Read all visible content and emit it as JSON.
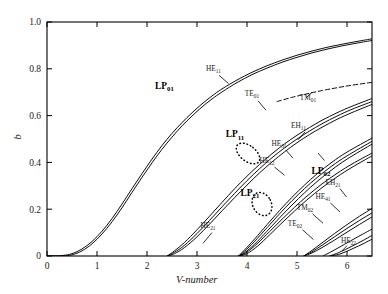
{
  "chart_data": {
    "type": "line",
    "title": "",
    "xlabel": "V-number",
    "ylabel": "b",
    "xlim": [
      0,
      6.5
    ],
    "ylim": [
      0,
      1.0
    ],
    "xticks": [
      0,
      1,
      2,
      3,
      4,
      5,
      6
    ],
    "xticklabels": [
      "0",
      "1",
      "2",
      "3",
      "4",
      "5",
      "6"
    ],
    "yticks": [
      0,
      0.2,
      0.4,
      0.6,
      0.8,
      1.0
    ],
    "yticklabels": [
      "0",
      "0.2",
      "0.4",
      "0.6",
      "0.8",
      "1.0"
    ],
    "grid": false,
    "legend": "none",
    "annotations": [
      {
        "text": "LP",
        "sub": "01",
        "bold": true,
        "x": 2.35,
        "y": 0.715
      },
      {
        "text": "LP",
        "sub": "11",
        "bold": true,
        "x": 3.76,
        "y": 0.508
      },
      {
        "text": "LP",
        "sub": "21",
        "bold": true,
        "x": 4.06,
        "y": 0.258
      },
      {
        "text": "LP",
        "sub": "02",
        "bold": true,
        "x": 5.48,
        "y": 0.352
      },
      {
        "text": "HE",
        "sub": "11",
        "bold": false,
        "x": 3.33,
        "y": 0.792
      },
      {
        "text": "TE",
        "sub": "01",
        "bold": false,
        "x": 4.1,
        "y": 0.683
      },
      {
        "text": "TM",
        "sub": "01",
        "bold": false,
        "x": 5.22,
        "y": 0.667
      },
      {
        "text": "EH",
        "sub": "11",
        "bold": false,
        "x": 5.03,
        "y": 0.548
      },
      {
        "text": "HE",
        "sub": "31",
        "bold": false,
        "x": 4.64,
        "y": 0.47
      },
      {
        "text": "HE",
        "sub": "12",
        "bold": false,
        "x": 4.4,
        "y": 0.398
      },
      {
        "text": "HE",
        "sub": "21",
        "bold": false,
        "x": 3.22,
        "y": 0.118
      },
      {
        "text": "EH",
        "sub": "21",
        "bold": false,
        "x": 5.72,
        "y": 0.305
      },
      {
        "text": "HE",
        "sub": "41",
        "bold": false,
        "x": 5.52,
        "y": 0.243
      },
      {
        "text": "TM",
        "sub": "02",
        "bold": false,
        "x": 5.16,
        "y": 0.196
      },
      {
        "text": "TE",
        "sub": "02",
        "bold": false,
        "x": 4.96,
        "y": 0.128
      },
      {
        "text": "HE",
        "sub": "22",
        "bold": false,
        "x": 6.03,
        "y": 0.055
      }
    ],
    "series": [
      {
        "name": "LP01-upper",
        "style": "solid",
        "points": [
          [
            0.0,
            0.0
          ],
          [
            0.3,
            0.002
          ],
          [
            0.5,
            0.01
          ],
          [
            0.7,
            0.03
          ],
          [
            0.9,
            0.062
          ],
          [
            1.1,
            0.106
          ],
          [
            1.3,
            0.16
          ],
          [
            1.5,
            0.222
          ],
          [
            1.7,
            0.288
          ],
          [
            1.9,
            0.352
          ],
          [
            2.1,
            0.414
          ],
          [
            2.3,
            0.472
          ],
          [
            2.5,
            0.524
          ],
          [
            2.7,
            0.57
          ],
          [
            2.9,
            0.612
          ],
          [
            3.1,
            0.65
          ],
          [
            3.3,
            0.684
          ],
          [
            3.5,
            0.714
          ],
          [
            3.8,
            0.752
          ],
          [
            4.1,
            0.785
          ],
          [
            4.4,
            0.813
          ],
          [
            4.7,
            0.837
          ],
          [
            5.0,
            0.858
          ],
          [
            5.3,
            0.876
          ],
          [
            5.6,
            0.892
          ],
          [
            5.9,
            0.905
          ],
          [
            6.2,
            0.917
          ],
          [
            6.5,
            0.928
          ]
        ]
      },
      {
        "name": "LP01-lower",
        "style": "solid",
        "points": [
          [
            0.0,
            0.0
          ],
          [
            0.3,
            0.0
          ],
          [
            0.5,
            0.005
          ],
          [
            0.7,
            0.022
          ],
          [
            0.9,
            0.052
          ],
          [
            1.1,
            0.094
          ],
          [
            1.3,
            0.146
          ],
          [
            1.5,
            0.206
          ],
          [
            1.7,
            0.272
          ],
          [
            1.9,
            0.336
          ],
          [
            2.1,
            0.398
          ],
          [
            2.3,
            0.456
          ],
          [
            2.5,
            0.508
          ],
          [
            2.7,
            0.556
          ],
          [
            2.9,
            0.598
          ],
          [
            3.1,
            0.637
          ],
          [
            3.3,
            0.671
          ],
          [
            3.5,
            0.701
          ],
          [
            3.8,
            0.741
          ],
          [
            4.1,
            0.775
          ],
          [
            4.4,
            0.803
          ],
          [
            4.7,
            0.828
          ],
          [
            5.0,
            0.849
          ],
          [
            5.3,
            0.868
          ],
          [
            5.6,
            0.884
          ],
          [
            5.9,
            0.898
          ],
          [
            6.2,
            0.91
          ],
          [
            6.5,
            0.921
          ]
        ]
      },
      {
        "name": "TE01",
        "style": "solid",
        "points": [
          [
            2.405,
            0.0
          ],
          [
            2.55,
            0.016
          ],
          [
            2.75,
            0.046
          ],
          [
            3.0,
            0.096
          ],
          [
            3.25,
            0.152
          ],
          [
            3.5,
            0.21
          ],
          [
            3.75,
            0.267
          ],
          [
            4.0,
            0.322
          ],
          [
            4.25,
            0.373
          ],
          [
            4.5,
            0.42
          ],
          [
            4.75,
            0.462
          ],
          [
            5.0,
            0.5
          ],
          [
            5.25,
            0.534
          ],
          [
            5.5,
            0.565
          ],
          [
            5.8,
            0.598
          ],
          [
            6.1,
            0.627
          ],
          [
            6.5,
            0.66
          ]
        ]
      },
      {
        "name": "HE11b",
        "style": "solid",
        "points": [
          [
            2.405,
            0.0
          ],
          [
            2.55,
            0.022
          ],
          [
            2.75,
            0.058
          ],
          [
            3.0,
            0.112
          ],
          [
            3.25,
            0.17
          ],
          [
            3.5,
            0.229
          ],
          [
            3.75,
            0.287
          ],
          [
            4.0,
            0.341
          ],
          [
            4.25,
            0.391
          ],
          [
            4.5,
            0.437
          ],
          [
            4.75,
            0.479
          ],
          [
            5.0,
            0.516
          ],
          [
            5.25,
            0.549
          ],
          [
            5.5,
            0.58
          ],
          [
            5.8,
            0.612
          ],
          [
            6.1,
            0.64
          ],
          [
            6.5,
            0.673
          ]
        ]
      },
      {
        "name": "TM01",
        "style": "solid",
        "points": [
          [
            2.405,
            0.0
          ],
          [
            2.55,
            0.01
          ],
          [
            2.75,
            0.036
          ],
          [
            3.0,
            0.082
          ],
          [
            3.25,
            0.136
          ],
          [
            3.5,
            0.193
          ],
          [
            3.75,
            0.249
          ],
          [
            4.0,
            0.303
          ],
          [
            4.25,
            0.355
          ],
          [
            4.5,
            0.402
          ],
          [
            4.75,
            0.445
          ],
          [
            5.0,
            0.484
          ],
          [
            5.25,
            0.519
          ],
          [
            5.5,
            0.55
          ],
          [
            5.8,
            0.584
          ],
          [
            6.1,
            0.613
          ],
          [
            6.5,
            0.648
          ]
        ]
      },
      {
        "name": "LP11-dashed",
        "style": "dashed",
        "points": [
          [
            4.6,
            0.66
          ],
          [
            4.9,
            0.678
          ],
          [
            5.2,
            0.693
          ],
          [
            5.5,
            0.707
          ],
          [
            5.8,
            0.719
          ],
          [
            6.1,
            0.73
          ],
          [
            6.5,
            0.742
          ]
        ]
      },
      {
        "name": "LP21-HE21",
        "style": "solid",
        "points": [
          [
            3.832,
            0.0
          ],
          [
            3.95,
            0.02
          ],
          [
            4.15,
            0.062
          ],
          [
            4.4,
            0.121
          ],
          [
            4.65,
            0.18
          ],
          [
            4.9,
            0.236
          ],
          [
            5.15,
            0.288
          ],
          [
            5.4,
            0.335
          ],
          [
            5.7,
            0.385
          ],
          [
            6.0,
            0.428
          ],
          [
            6.5,
            0.49
          ]
        ]
      },
      {
        "name": "LP21-EH11",
        "style": "solid",
        "points": [
          [
            3.832,
            0.0
          ],
          [
            3.95,
            0.014
          ],
          [
            4.15,
            0.05
          ],
          [
            4.4,
            0.106
          ],
          [
            4.65,
            0.163
          ],
          [
            4.9,
            0.218
          ],
          [
            5.15,
            0.27
          ],
          [
            5.4,
            0.318
          ],
          [
            5.7,
            0.369
          ],
          [
            6.0,
            0.414
          ],
          [
            6.5,
            0.478
          ]
        ]
      },
      {
        "name": "LP21-HE31",
        "style": "solid",
        "points": [
          [
            3.832,
            0.0
          ],
          [
            3.95,
            0.026
          ],
          [
            4.15,
            0.072
          ],
          [
            4.4,
            0.134
          ],
          [
            4.65,
            0.194
          ],
          [
            4.9,
            0.251
          ],
          [
            5.15,
            0.303
          ],
          [
            5.4,
            0.351
          ],
          [
            5.7,
            0.401
          ],
          [
            6.0,
            0.444
          ],
          [
            6.5,
            0.504
          ]
        ]
      },
      {
        "name": "LP02-HE12",
        "style": "solid",
        "points": [
          [
            3.832,
            0.0
          ],
          [
            3.98,
            0.014
          ],
          [
            4.2,
            0.052
          ],
          [
            4.45,
            0.104
          ],
          [
            4.7,
            0.157
          ],
          [
            4.95,
            0.208
          ],
          [
            5.2,
            0.256
          ],
          [
            5.5,
            0.308
          ],
          [
            5.8,
            0.353
          ],
          [
            6.1,
            0.393
          ],
          [
            6.5,
            0.44
          ]
        ]
      },
      {
        "name": "LP02-lower",
        "style": "solid",
        "points": [
          [
            3.832,
            0.0
          ],
          [
            3.98,
            0.008
          ],
          [
            4.2,
            0.04
          ],
          [
            4.45,
            0.09
          ],
          [
            4.7,
            0.142
          ],
          [
            4.95,
            0.192
          ],
          [
            5.2,
            0.24
          ],
          [
            5.5,
            0.292
          ],
          [
            5.8,
            0.338
          ],
          [
            6.1,
            0.379
          ],
          [
            6.5,
            0.428
          ]
        ]
      },
      {
        "name": "TE02",
        "style": "solid",
        "points": [
          [
            5.136,
            0.0
          ],
          [
            5.3,
            0.018
          ],
          [
            5.5,
            0.046
          ],
          [
            5.75,
            0.082
          ],
          [
            6.0,
            0.118
          ],
          [
            6.25,
            0.152
          ],
          [
            6.5,
            0.184
          ]
        ]
      },
      {
        "name": "TM02",
        "style": "solid",
        "points": [
          [
            5.136,
            0.0
          ],
          [
            5.3,
            0.024
          ],
          [
            5.5,
            0.056
          ],
          [
            5.75,
            0.096
          ],
          [
            6.0,
            0.134
          ],
          [
            6.25,
            0.17
          ],
          [
            6.5,
            0.203
          ]
        ]
      },
      {
        "name": "EH21",
        "style": "solid",
        "points": [
          [
            5.136,
            0.0
          ],
          [
            5.3,
            0.013
          ],
          [
            5.5,
            0.036
          ],
          [
            5.75,
            0.068
          ],
          [
            6.0,
            0.102
          ],
          [
            6.25,
            0.135
          ],
          [
            6.5,
            0.167
          ]
        ]
      },
      {
        "name": "HE41",
        "style": "solid",
        "points": [
          [
            5.52,
            0.0
          ],
          [
            5.7,
            0.02
          ],
          [
            5.95,
            0.05
          ],
          [
            6.2,
            0.08
          ],
          [
            6.5,
            0.115
          ]
        ]
      },
      {
        "name": "HE22",
        "style": "solid",
        "points": [
          [
            5.65,
            0.0
          ],
          [
            5.85,
            0.016
          ],
          [
            6.1,
            0.042
          ],
          [
            6.3,
            0.064
          ],
          [
            6.5,
            0.088
          ]
        ]
      },
      {
        "name": "HE22b",
        "style": "solid",
        "points": [
          [
            5.68,
            0.0
          ],
          [
            5.88,
            0.01
          ],
          [
            6.12,
            0.032
          ],
          [
            6.32,
            0.052
          ],
          [
            6.5,
            0.072
          ]
        ]
      }
    ],
    "leader_lines": [
      {
        "from": [
          3.44,
          0.772
        ],
        "to": [
          3.63,
          0.737
        ]
      },
      {
        "from": [
          4.22,
          0.663
        ],
        "to": [
          4.38,
          0.623
        ]
      },
      {
        "from": [
          5.3,
          0.7
        ],
        "to": [
          5.18,
          0.676
        ]
      },
      {
        "from": [
          5.16,
          0.53
        ],
        "to": [
          5.02,
          0.496
        ]
      },
      {
        "from": [
          4.78,
          0.452
        ],
        "to": [
          4.92,
          0.418
        ]
      },
      {
        "from": [
          4.55,
          0.38
        ],
        "to": [
          4.75,
          0.345
        ]
      },
      {
        "from": [
          3.3,
          0.1
        ],
        "to": [
          3.12,
          0.054
        ]
      },
      {
        "from": [
          5.86,
          0.288
        ],
        "to": [
          5.99,
          0.252
        ]
      },
      {
        "from": [
          5.67,
          0.226
        ],
        "to": [
          5.86,
          0.188
        ]
      },
      {
        "from": [
          5.31,
          0.18
        ],
        "to": [
          5.52,
          0.14
        ]
      },
      {
        "from": [
          5.11,
          0.112
        ],
        "to": [
          5.33,
          0.07
        ]
      },
      {
        "from": [
          6.0,
          0.044
        ],
        "to": [
          5.9,
          0.022
        ]
      },
      {
        "from": [
          5.55,
          0.408
        ],
        "to": [
          5.42,
          0.44
        ]
      }
    ],
    "ellipses": [
      {
        "cx": 4.02,
        "cy": 0.438,
        "rx": 0.155,
        "ry": 0.058,
        "rot": 52,
        "style": "dotted"
      },
      {
        "cx": 4.3,
        "cy": 0.222,
        "rx": 0.185,
        "ry": 0.052,
        "rot": 28,
        "style": "dotted"
      }
    ]
  },
  "axes": {
    "ylabel": "b",
    "xlabel_pre": "V",
    "xlabel_post": "-number"
  }
}
